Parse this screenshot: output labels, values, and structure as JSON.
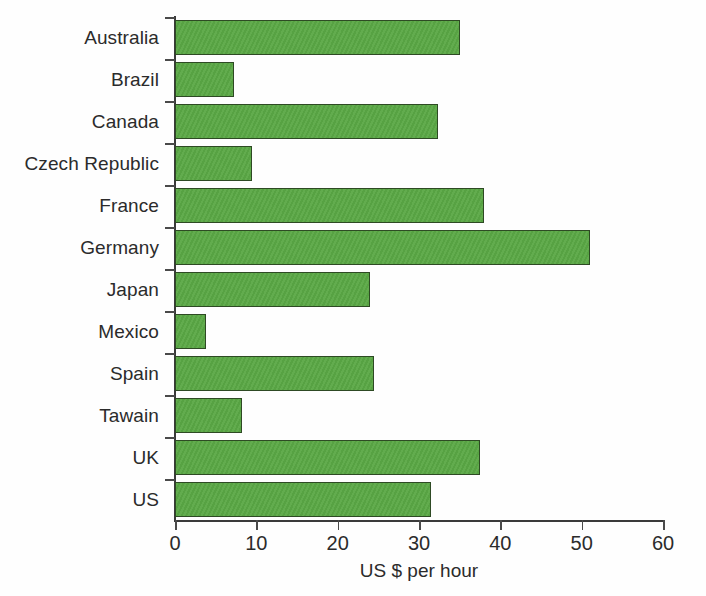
{
  "chart_data": {
    "type": "bar",
    "orientation": "horizontal",
    "title": "",
    "subtitle": "",
    "xlabel": "US $ per hour",
    "ylabel": "",
    "xlim": [
      0,
      60
    ],
    "ylim": null,
    "xticks": [
      0,
      10,
      20,
      30,
      40,
      50,
      60
    ],
    "grid": false,
    "legend": null,
    "bar_color": "#5aa845",
    "bar_border_color": "#2e4a24",
    "axis_color": "#3a3a3a",
    "categories": [
      "Australia",
      "Brazil",
      "Canada",
      "Czech Republic",
      "France",
      "Germany",
      "Japan",
      "Mexico",
      "Spain",
      "Tawain",
      "UK",
      "US"
    ],
    "values": [
      35.0,
      7.3,
      32.3,
      9.5,
      38.0,
      51.0,
      24.0,
      3.8,
      24.5,
      8.2,
      37.5,
      31.5
    ],
    "units": "US $ per hour"
  }
}
